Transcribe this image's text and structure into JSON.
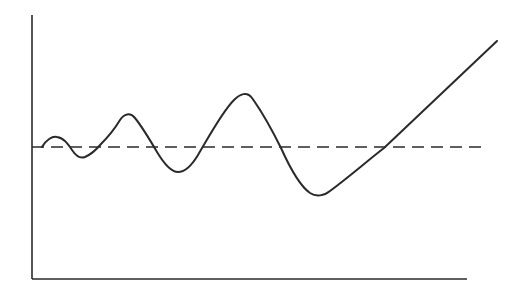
{
  "chart_data": {
    "type": "line",
    "title": "",
    "xlabel": "",
    "ylabel": "",
    "grid": false,
    "legend": null,
    "reference_line": {
      "style": "dashed",
      "y": 0
    },
    "series": [
      {
        "name": "response",
        "style": "solid",
        "points": [
          {
            "x": 0.02,
            "y": 0.0
          },
          {
            "x": 0.05,
            "y": 0.07
          },
          {
            "x": 0.07,
            "y": 0.04
          },
          {
            "x": 0.12,
            "y": -0.08
          },
          {
            "x": 0.16,
            "y": 0.0
          },
          {
            "x": 0.22,
            "y": 0.24
          },
          {
            "x": 0.28,
            "y": 0.0
          },
          {
            "x": 0.34,
            "y": -0.19
          },
          {
            "x": 0.39,
            "y": 0.0
          },
          {
            "x": 0.49,
            "y": 0.4
          },
          {
            "x": 0.57,
            "y": 0.0
          },
          {
            "x": 0.66,
            "y": -0.37
          },
          {
            "x": 0.8,
            "y": 0.0
          },
          {
            "x": 1.06,
            "y": 0.8
          }
        ]
      }
    ],
    "xlim": [
      0,
      1.0
    ],
    "ylim": [
      -1.0,
      1.0
    ]
  },
  "colors": {
    "line": "#2a2a2a",
    "background": "#ffffff"
  },
  "geometry": {
    "y_axis": {
      "x": 32,
      "y1": 15,
      "y2": 279
    },
    "x_axis": {
      "y": 279,
      "x1": 32,
      "x2": 467
    },
    "baseline": {
      "y": 147,
      "x1": 32,
      "x2": 487
    },
    "curve_path": "M42,147 C46,140 52,136 57,137 C64,138 68,144 72,150 C76,156 80,159 85,157 C92,154 96,150 101,144 C108,137 114,130 120,120 C124,114 130,112 135,118 C143,128 150,140 157,152 C163,162 170,172 178,172 C186,172 192,165 198,155 C210,135 222,112 234,100 C240,94 247,91 252,98 C262,112 272,130 281,148 C290,168 300,186 310,193 C316,197 324,196 330,191 C350,176 366,162 384,148 L497,41"
  }
}
